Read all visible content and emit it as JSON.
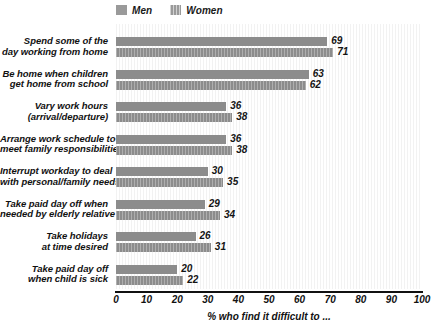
{
  "chart_data": {
    "type": "bar",
    "orientation": "horizontal",
    "title": "",
    "xlabel": "% who find it difficult to ...",
    "ylabel": "",
    "xlim": [
      0,
      100
    ],
    "xticks": [
      0,
      10,
      20,
      30,
      40,
      50,
      60,
      70,
      80,
      90,
      100
    ],
    "grid": false,
    "legend_position": "top-left",
    "categories": [
      "Spend some of the day working from home",
      "Be home when children get home from school",
      "Vary work hours (arrival/departure)",
      "Arrange work schedule to meet family responsibilities",
      "Interrupt workday to deal with personal/family needs",
      "Take paid day off when needed by elderly relative",
      "Take holidays at time desired",
      "Take paid day off when child is sick"
    ],
    "category_lines": [
      [
        "Spend some of the",
        "day working from home"
      ],
      [
        "Be home when children",
        "get home from school"
      ],
      [
        "Vary work hours",
        "(arrival/departure)"
      ],
      [
        "Arrange work schedule to",
        "meet family responsibilities"
      ],
      [
        "Interrupt workday to deal",
        "with personal/family needs"
      ],
      [
        "Take paid day off when",
        "needed by elderly relative"
      ],
      [
        "Take holidays",
        "at time desired"
      ],
      [
        "Take paid day off",
        "when child is sick"
      ]
    ],
    "series": [
      {
        "name": "Men",
        "color": "#8c8c8c",
        "values": [
          69,
          63,
          36,
          36,
          30,
          29,
          26,
          20
        ]
      },
      {
        "name": "Women",
        "color": "#8c8c8c",
        "values": [
          71,
          62,
          38,
          38,
          35,
          34,
          31,
          22
        ]
      }
    ]
  },
  "legend": {
    "items": [
      {
        "label": "Men",
        "swatch": "men-swatch"
      },
      {
        "label": "Women",
        "swatch": "women-swatch"
      }
    ]
  },
  "axis": {
    "x_label": "% who find it difficult to ...",
    "x_ticks": [
      "0",
      "10",
      "20",
      "30",
      "40",
      "50",
      "60",
      "70",
      "80",
      "90",
      "100"
    ]
  }
}
